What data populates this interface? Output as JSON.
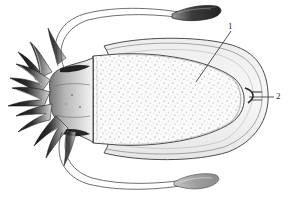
{
  "figure": {
    "view": "dorsal",
    "background_color": "#ffffff",
    "ink_color": "#2b2b2b",
    "stipple_color": "#b9b9b9",
    "fin_fill": "#f2f2f2",
    "mantle_fill": "#fbfbfb",
    "arm_dark": "#1a1a1a"
  },
  "labels": [
    {
      "id": "1",
      "text": "1",
      "target": "mantle",
      "leader": "diagonal"
    },
    {
      "id": "2",
      "text": "2",
      "target": "posterior-tip",
      "leader": "horizontal"
    }
  ],
  "parts": {
    "mantle": "mantle",
    "fin": "fin",
    "head": "head",
    "arms": "arms",
    "tentacle_stalk_upper": "tentacle-stalk-upper",
    "tentacle_stalk_lower": "tentacle-stalk-lower",
    "tentacle_club_upper": "tentacle-club-upper",
    "tentacle_club_lower": "tentacle-club-lower",
    "posterior_tip": "posterior-tip"
  }
}
